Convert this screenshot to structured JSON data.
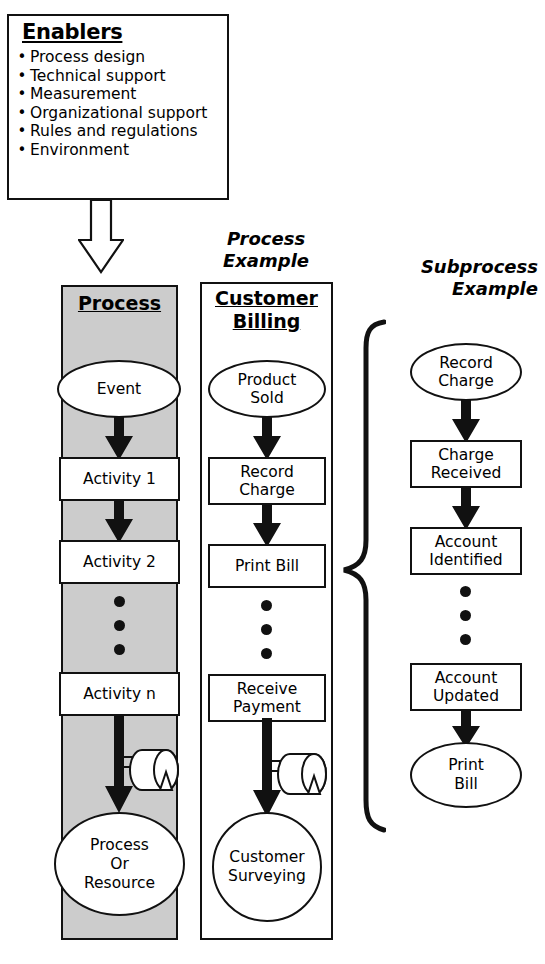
{
  "enablers": {
    "title": "Enablers",
    "bullet": "•",
    "items": [
      "Process design",
      "Technical support",
      "Measurement",
      "Organizational support",
      "Rules and regulations",
      "Environment"
    ]
  },
  "arrows": {
    "enabler_to_process": "down-block-arrow"
  },
  "process_column": {
    "heading": "Process",
    "nodes": [
      {
        "label": "Event",
        "shape": "ellipse"
      },
      {
        "label": "Activity 1",
        "shape": "rect"
      },
      {
        "label": "Activity 2",
        "shape": "rect"
      },
      {
        "label": "⋮",
        "shape": "dots"
      },
      {
        "label": "Activity n",
        "shape": "rect"
      },
      {
        "label": "Process Or Resource",
        "shape": "ellipse"
      }
    ],
    "node_labels": {
      "event": "Event",
      "activity1": "Activity 1",
      "activity2": "Activity 2",
      "activityn": "Activity n",
      "terminal_l1": "Process",
      "terminal_l2": "Or",
      "terminal_l3": "Resource"
    },
    "storage_symbol": "cylinder-storage-icon",
    "fill": "#cccccc"
  },
  "billing_column": {
    "caption_l1": "Process",
    "caption_l2": "Example",
    "heading_l1": "Customer",
    "heading_l2": "Billing",
    "node_labels": {
      "start_l1": "Product",
      "start_l2": "Sold",
      "record_l1": "Record",
      "record_l2": "Charge",
      "print": "Print Bill",
      "receive_l1": "Receive",
      "receive_l2": "Payment",
      "terminal_l1": "Customer",
      "terminal_l2": "Surveying"
    },
    "storage_symbol": "cylinder-storage-icon",
    "fill": "#ffffff"
  },
  "subprocess_column": {
    "caption_l1": "Subprocess",
    "caption_l2": "Example",
    "node_labels": {
      "start_l1": "Record",
      "start_l2": "Charge",
      "step1_l1": "Charge",
      "step1_l2": "Received",
      "step2_l1": "Account",
      "step2_l2": "Identified",
      "step3_l1": "Account",
      "step3_l2": "Updated",
      "terminal_l1": "Print",
      "terminal_l2": "Bill"
    },
    "brace": "curly-brace-icon"
  },
  "colors": {
    "stroke": "#111111",
    "process_panel_fill": "#cccccc",
    "page_background": "#ffffff"
  }
}
